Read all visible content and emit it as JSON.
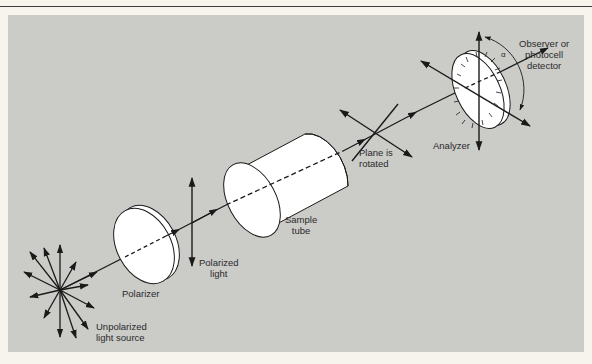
{
  "figure": {
    "type": "polarimeter-schematic",
    "colors": {
      "page_background": "#f6f4ec",
      "panel_background": "#cbcbc8",
      "line": "#1a1a1a",
      "optic_fill": "#ffffff"
    }
  },
  "labels": {
    "source": "Unpolarized\nlight source",
    "polarizer": "Polarizer",
    "polarized_light": "Polarized\nlight",
    "sample_tube": "Sample\ntube",
    "plane_rotated": "Plane is\nrotated",
    "analyzer": "Analyzer",
    "detector": "Observer or\nphotocell\ndetector",
    "angle": "α"
  },
  "components": [
    {
      "id": "source",
      "name": "Unpolarized light source"
    },
    {
      "id": "polarizer",
      "name": "Polarizer"
    },
    {
      "id": "polarized_light",
      "name": "Polarized light"
    },
    {
      "id": "sample_tube",
      "name": "Sample tube"
    },
    {
      "id": "plane_rotated",
      "name": "Plane is rotated"
    },
    {
      "id": "analyzer",
      "name": "Analyzer"
    },
    {
      "id": "detector",
      "name": "Observer or photocell detector"
    }
  ]
}
